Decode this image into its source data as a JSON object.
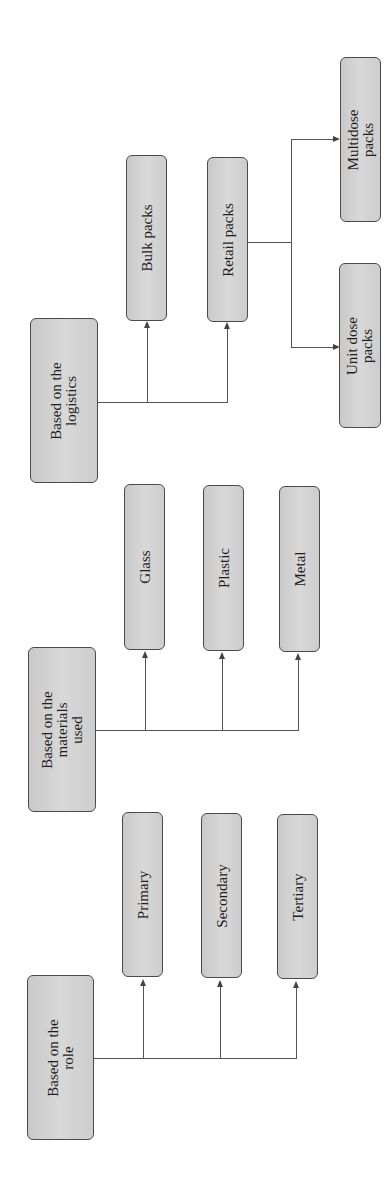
{
  "diagram": {
    "orientation": "rotated-90-ccw",
    "groups": [
      {
        "id": "logistics",
        "root": "Based on the\nlogistics",
        "children": [
          {
            "label": "Bulk packs"
          },
          {
            "label": "Retail packs",
            "children": [
              {
                "label": "Multidose\npacks"
              },
              {
                "label": "Unit dose\npacks"
              }
            ]
          }
        ]
      },
      {
        "id": "materials",
        "root": "Based on the\nmaterials\nused",
        "children": [
          {
            "label": "Glass"
          },
          {
            "label": "Plastic"
          },
          {
            "label": "Metal"
          }
        ]
      },
      {
        "id": "role",
        "root": "Based on the\nrole",
        "children": [
          {
            "label": "Primary"
          },
          {
            "label": "Secondary"
          },
          {
            "label": "Tertiary"
          }
        ]
      }
    ],
    "colors": {
      "box_fill": "#d0d0d0",
      "box_border": "#4a4a4a",
      "line": "#555555",
      "text": "#1e1e1e"
    }
  }
}
